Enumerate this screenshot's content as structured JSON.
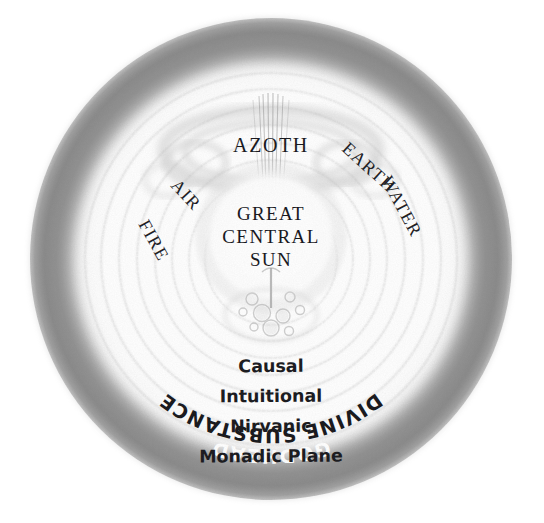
{
  "diagram": {
    "title_outer": "GODHEAD",
    "ring_label_divine": "DIVINE SUBSTANCE",
    "azoth": "AZOTH",
    "center": {
      "line1": "GREAT",
      "line2": "CENTRAL",
      "line3": "SUN"
    },
    "elements": [
      {
        "name": "FIRE",
        "side": "left"
      },
      {
        "name": "AIR",
        "side": "left"
      },
      {
        "name": "EARTH",
        "side": "right"
      },
      {
        "name": "WATER",
        "side": "right"
      }
    ],
    "planes": [
      "Causal",
      "Intuitional",
      "Nirvanic",
      "Monadic Plane"
    ],
    "colors": {
      "background": "#ffffff",
      "outer_ring": "#8d8d8d",
      "outer_ring_dark": "#7a7a7a",
      "inner_glow": "#ffffff",
      "faint_ring": "#c9c9c9",
      "text_dark": "#16161a",
      "text_light": "#ffffff"
    },
    "geometry": {
      "center_x": 271,
      "center_y": 259,
      "outer_radius": 240
    }
  }
}
